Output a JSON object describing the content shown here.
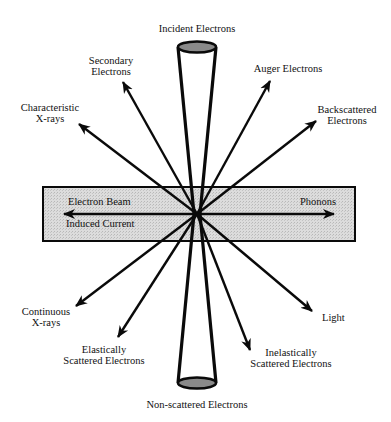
{
  "colors": {
    "line": "#0a0a0a",
    "specimen_fill": "#d6d6d6",
    "ellipse_fill": "#8a8a8a",
    "background": "#ffffff"
  },
  "labels": {
    "incident": "Incident Electrons",
    "secondary_1": "Secondary",
    "secondary_2": "Electrons",
    "characteristic_1": "Characteristic",
    "characteristic_2": "X-rays",
    "auger": "Auger Electrons",
    "backscattered_1": "Backscattered",
    "backscattered_2": "Electrons",
    "electron_beam": "Electron Beam",
    "induced_current": "Induced Current",
    "phonons": "Phonons",
    "continuous_1": "Continuous",
    "continuous_2": "X-rays",
    "elastic_1": "Elastically",
    "elastic_2": "Scattered Electrons",
    "light": "Light",
    "inelastic_1": "Inelastically",
    "inelastic_2": "Scattered Electrons",
    "nonscattered": "Non-scattered Electrons"
  }
}
